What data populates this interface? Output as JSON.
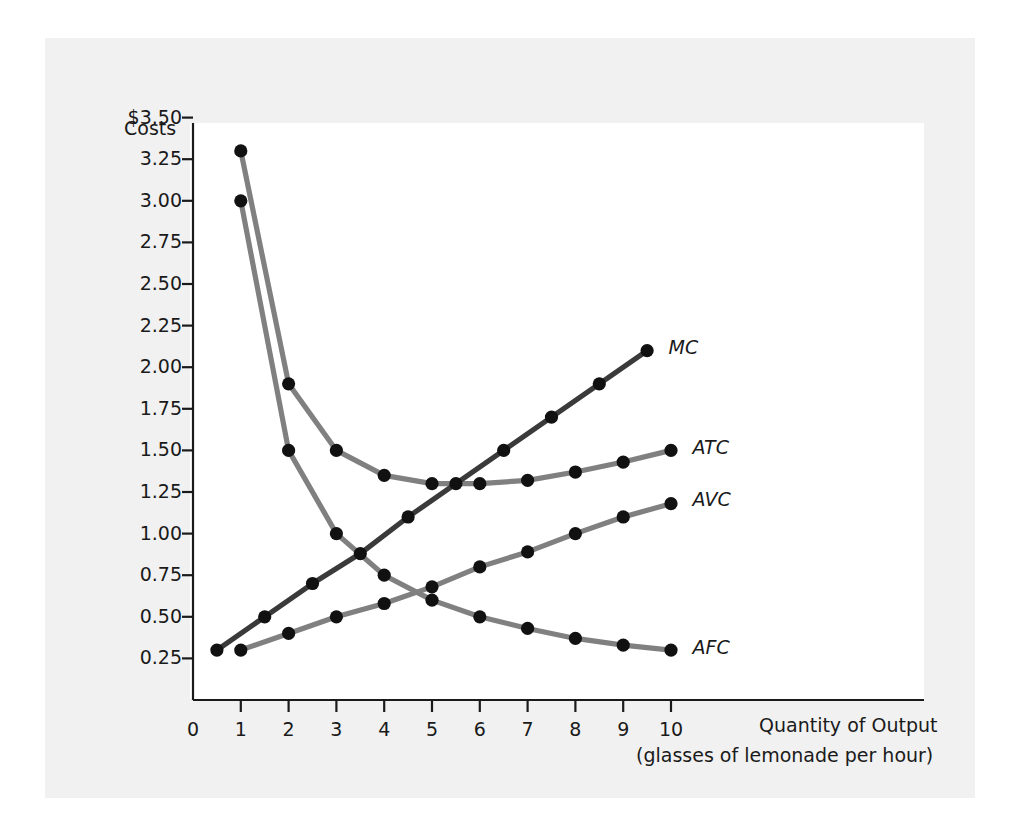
{
  "figure": {
    "y_axis_title": "Costs",
    "x_axis_title_line1": "Quantity of Output",
    "x_axis_title_line2": "(glasses of lemonade per hour)",
    "origin_label": "0",
    "colors": {
      "page_background": "#f1f1f1",
      "panel_background": "#ffffff",
      "axis": "#1a1a1a",
      "mc_curve": "#3a3a3a",
      "gray_curve": "#808080",
      "marker": "#111111",
      "text": "#1a1a1a"
    }
  },
  "chart_data": {
    "type": "line",
    "title": "",
    "subtitle": "",
    "xlabel": "Quantity of Output (glasses of lemonade per hour)",
    "ylabel": "Costs",
    "xlim": [
      0,
      10.9
    ],
    "ylim": [
      0,
      3.625
    ],
    "grid": false,
    "legend_position": "right-of-curve-ends",
    "x_ticks": [
      0,
      1,
      2,
      3,
      4,
      5,
      6,
      7,
      8,
      9,
      10
    ],
    "x_tick_labels": [
      "0",
      "1",
      "2",
      "3",
      "4",
      "5",
      "6",
      "7",
      "8",
      "9",
      "10"
    ],
    "y_ticks": [
      0.25,
      0.5,
      0.75,
      1.0,
      1.25,
      1.5,
      1.75,
      2.0,
      2.25,
      2.5,
      2.75,
      3.0,
      3.25,
      3.5
    ],
    "y_tick_labels": [
      "0.25",
      "0.50",
      "0.75",
      "1.00",
      "1.25",
      "1.50",
      "1.75",
      "2.00",
      "2.25",
      "2.50",
      "2.75",
      "3.00",
      "3.25",
      "$3.50"
    ],
    "series": [
      {
        "name": "MC",
        "label": "MC",
        "color": "#3a3a3a",
        "x": [
          0.5,
          1.5,
          2.5,
          3.5,
          4.5,
          5.5,
          6.5,
          7.5,
          8.5,
          9.5
        ],
        "y": [
          0.3,
          0.5,
          0.7,
          0.88,
          1.1,
          1.3,
          1.5,
          1.7,
          1.9,
          2.1
        ]
      },
      {
        "name": "ATC",
        "label": "ATC",
        "color": "#808080",
        "x": [
          1,
          2,
          3,
          4,
          5,
          6,
          7,
          8,
          9,
          10
        ],
        "y": [
          3.3,
          1.9,
          1.5,
          1.35,
          1.3,
          1.3,
          1.32,
          1.37,
          1.43,
          1.5
        ]
      },
      {
        "name": "AVC",
        "label": "AVC",
        "color": "#808080",
        "x": [
          1,
          2,
          3,
          4,
          5,
          6,
          7,
          8,
          9,
          10
        ],
        "y": [
          0.3,
          0.4,
          0.5,
          0.58,
          0.68,
          0.8,
          0.89,
          1.0,
          1.1,
          1.18
        ]
      },
      {
        "name": "AFC",
        "label": "AFC",
        "color": "#808080",
        "x": [
          1,
          2,
          3,
          4,
          5,
          6,
          7,
          8,
          9,
          10
        ],
        "y": [
          3.0,
          1.5,
          1.0,
          0.75,
          0.6,
          0.5,
          0.43,
          0.37,
          0.33,
          0.3
        ]
      }
    ],
    "curve_labels": [
      {
        "text": "MC",
        "x": 9.95,
        "y": 2.12
      },
      {
        "text": "ATC",
        "x": 10.45,
        "y": 1.52
      },
      {
        "text": "AVC",
        "x": 10.45,
        "y": 1.21
      },
      {
        "text": "AFC",
        "x": 10.45,
        "y": 0.32
      }
    ]
  }
}
